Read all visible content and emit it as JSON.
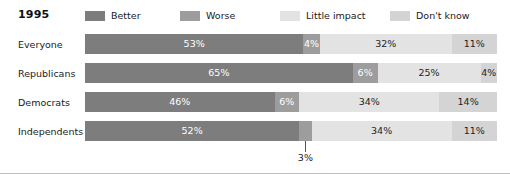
{
  "title": "1995",
  "colors": {
    "better": "#7d7d7d",
    "worse": "#9d9d9d",
    "little_impact": "#e3e3e3",
    "dont_know": "#d4d4d4",
    "text": "#1a1a1a",
    "callout_line": "#555555"
  },
  "legend": [
    {
      "label": "Better",
      "key": "better"
    },
    {
      "label": "Worse",
      "key": "worse"
    },
    {
      "label": "Little impact",
      "key": "little_impact"
    },
    {
      "label": "Don't know",
      "key": "dont_know"
    }
  ],
  "chart_data": {
    "type": "bar",
    "orientation": "horizontal",
    "stacked": true,
    "normalized": true,
    "title": "1995",
    "xlabel": "",
    "ylabel": "",
    "xlim": [
      0,
      100
    ],
    "grid": false,
    "legend_position": "top",
    "value_suffix": "%",
    "categories": [
      "Everyone",
      "Republicans",
      "Democrats",
      "Independents"
    ],
    "series": [
      {
        "name": "Better",
        "values": [
          53,
          65,
          46,
          52
        ]
      },
      {
        "name": "Worse",
        "values": [
          4,
          6,
          6,
          3
        ]
      },
      {
        "name": "Little impact",
        "values": [
          32,
          25,
          34,
          34
        ]
      },
      {
        "name": "Don't know",
        "values": [
          11,
          4,
          14,
          11
        ]
      }
    ],
    "annotations": [
      {
        "text": "3%",
        "category": "Independents",
        "series": "Worse",
        "value": 3,
        "placement": "below-bar-with-leader-line"
      }
    ]
  },
  "rows": [
    {
      "label": "Everyone",
      "segments": [
        {
          "series": "Better",
          "label": "53%",
          "value": 53,
          "color_key": "better",
          "label_style": "on-dark",
          "label_visible": true
        },
        {
          "series": "Worse",
          "label": "4%",
          "value": 4,
          "color_key": "worse",
          "label_style": "on-dark",
          "label_visible": true
        },
        {
          "series": "Little impact",
          "label": "32%",
          "value": 32,
          "color_key": "little_impact",
          "label_style": "on-light",
          "label_visible": true
        },
        {
          "series": "Don't know",
          "label": "11%",
          "value": 11,
          "color_key": "dont_know",
          "label_style": "on-light",
          "label_visible": true
        }
      ]
    },
    {
      "label": "Republicans",
      "segments": [
        {
          "series": "Better",
          "label": "65%",
          "value": 65,
          "color_key": "better",
          "label_style": "on-dark",
          "label_visible": true
        },
        {
          "series": "Worse",
          "label": "6%",
          "value": 6,
          "color_key": "worse",
          "label_style": "on-dark",
          "label_visible": true
        },
        {
          "series": "Little impact",
          "label": "25%",
          "value": 25,
          "color_key": "little_impact",
          "label_style": "on-light",
          "label_visible": true
        },
        {
          "series": "Don't know",
          "label": "4%",
          "value": 4,
          "color_key": "dont_know",
          "label_style": "on-light",
          "label_visible": true
        }
      ]
    },
    {
      "label": "Democrats",
      "segments": [
        {
          "series": "Better",
          "label": "46%",
          "value": 46,
          "color_key": "better",
          "label_style": "on-dark",
          "label_visible": true
        },
        {
          "series": "Worse",
          "label": "6%",
          "value": 6,
          "color_key": "worse",
          "label_style": "on-dark",
          "label_visible": true
        },
        {
          "series": "Little impact",
          "label": "34%",
          "value": 34,
          "color_key": "little_impact",
          "label_style": "on-light",
          "label_visible": true
        },
        {
          "series": "Don't know",
          "label": "14%",
          "value": 14,
          "color_key": "dont_know",
          "label_style": "on-light",
          "label_visible": true
        }
      ]
    },
    {
      "label": "Independents",
      "segments": [
        {
          "series": "Better",
          "label": "52%",
          "value": 52,
          "color_key": "better",
          "label_style": "on-dark",
          "label_visible": true
        },
        {
          "series": "Worse",
          "label": "3%",
          "value": 3,
          "color_key": "worse",
          "label_style": "on-dark",
          "label_visible": false,
          "callout": "3%"
        },
        {
          "series": "Little impact",
          "label": "34%",
          "value": 34,
          "color_key": "little_impact",
          "label_style": "on-light",
          "label_visible": true
        },
        {
          "series": "Don't know",
          "label": "11%",
          "value": 11,
          "color_key": "dont_know",
          "label_style": "on-light",
          "label_visible": true
        }
      ]
    }
  ]
}
